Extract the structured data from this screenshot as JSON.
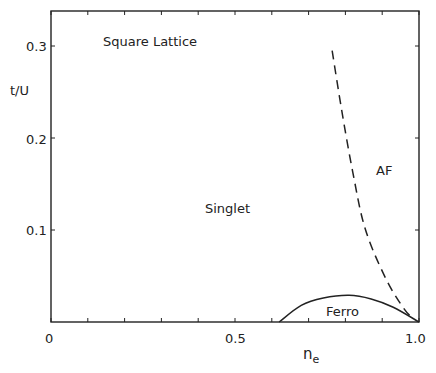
{
  "chart_data": {
    "type": "line",
    "title": "",
    "annotation_title": "Square Lattice",
    "xlabel": "n_e",
    "ylabel": "t/U",
    "xlim": [
      0,
      1.0
    ],
    "ylim": [
      0,
      0.34
    ],
    "x_ticks": [
      0,
      0.5,
      1.0
    ],
    "x_tick_labels": [
      "0",
      "0.5",
      "1.0"
    ],
    "x_minor_ticks": [
      0.1,
      0.2,
      0.3,
      0.4,
      0.6,
      0.7,
      0.8,
      0.9
    ],
    "y_ticks": [
      0.1,
      0.2,
      0.3
    ],
    "y_tick_labels": [
      "0.1",
      "0.2",
      "0.3"
    ],
    "grid": false,
    "regions": [
      "Singlet",
      "AF",
      "Ferro"
    ],
    "series": [
      {
        "name": "AF boundary",
        "style": "dashed",
        "points": [
          [
            0.764,
            0.295
          ],
          [
            0.79,
            0.23
          ],
          [
            0.82,
            0.163
          ],
          [
            0.854,
            0.101
          ],
          [
            0.91,
            0.047
          ],
          [
            0.96,
            0.014
          ],
          [
            0.985,
            0.004
          ]
        ]
      },
      {
        "name": "Ferro boundary",
        "style": "solid",
        "points": [
          [
            0.62,
            0.0
          ],
          [
            0.68,
            0.018
          ],
          [
            0.74,
            0.026
          ],
          [
            0.81,
            0.029
          ],
          [
            0.87,
            0.025
          ],
          [
            0.93,
            0.016
          ],
          [
            1.0,
            0.0
          ]
        ]
      }
    ]
  },
  "labels": {
    "title": "Square Lattice",
    "ylabel": "t/U",
    "xlabel_main": "n",
    "xlabel_sub": "e",
    "singlet": "Singlet",
    "af": "AF",
    "ferro": "Ferro",
    "y03": "0.3",
    "y02": "0.2",
    "y01": "0.1",
    "x0": "0",
    "x05": "0.5",
    "x10": "1.0"
  }
}
